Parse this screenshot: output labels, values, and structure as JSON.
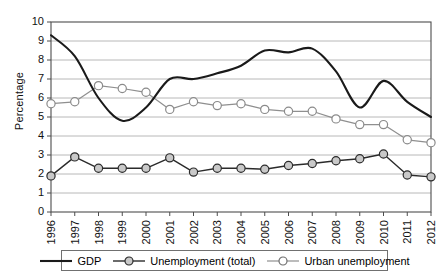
{
  "chart_data": {
    "type": "line",
    "title": "",
    "xlabel": "",
    "ylabel": "Percentage",
    "ylim": [
      0,
      10
    ],
    "ytick_labels": [
      "0",
      "1",
      "2",
      "3",
      "4",
      "5",
      "6",
      "7",
      "8",
      "9",
      "10"
    ],
    "grid": true,
    "legend_position": "bottom",
    "x": [
      1996,
      1997,
      1998,
      1999,
      2000,
      2001,
      2002,
      2003,
      2004,
      2005,
      2006,
      2007,
      2008,
      2009,
      2010,
      2011,
      2012
    ],
    "categories": [
      "1996",
      "1997",
      "1998",
      "1999",
      "2000",
      "2001",
      "2002",
      "2003",
      "2004",
      "2005",
      "2006",
      "2007",
      "2008",
      "2009",
      "2010",
      "2011",
      "2012"
    ],
    "series": [
      {
        "name": "GDP",
        "marker": "none",
        "color": "#1a1a1a",
        "values": [
          9.3,
          8.2,
          6.0,
          4.8,
          5.5,
          7.0,
          7.0,
          7.3,
          7.7,
          8.5,
          8.4,
          8.6,
          7.4,
          5.5,
          6.9,
          5.8,
          5.0
        ]
      },
      {
        "name": "Unemployment (total)",
        "marker": "filled-circle",
        "color": "#2b2b2b",
        "values": [
          1.9,
          2.9,
          2.3,
          2.3,
          2.3,
          2.85,
          2.1,
          2.3,
          2.3,
          2.25,
          2.45,
          2.55,
          2.7,
          2.8,
          3.05,
          1.95,
          1.85
        ]
      },
      {
        "name": "Urban unemployment",
        "marker": "open-circle",
        "color": "#8f8f8f",
        "values": [
          5.7,
          5.8,
          6.65,
          6.5,
          6.3,
          5.4,
          5.8,
          5.6,
          5.7,
          5.4,
          5.3,
          5.3,
          4.9,
          4.6,
          4.6,
          3.8,
          3.65
        ]
      }
    ]
  },
  "legend": {
    "items": [
      {
        "label": "GDP",
        "style": "line"
      },
      {
        "label": "Unemployment (total)",
        "style": "line-filled-marker"
      },
      {
        "label": "Urban unemployment",
        "style": "line-open-marker"
      }
    ]
  }
}
